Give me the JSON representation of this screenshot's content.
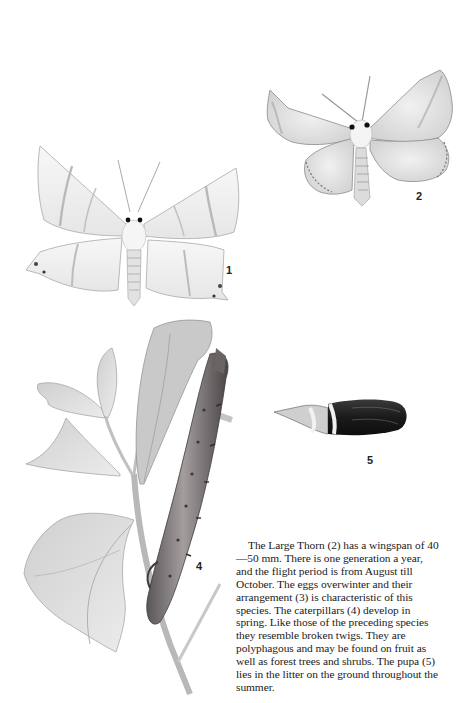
{
  "page": {
    "background": "#ffffff",
    "ink_color": "#1a1a1a"
  },
  "figures": [
    {
      "id": 1,
      "label": "1",
      "subject": "moth-adult-pale-thorn-icon",
      "description": "pale moth with hooked wing tips, dorsal view"
    },
    {
      "id": 2,
      "label": "2",
      "subject": "moth-adult-large-thorn-icon",
      "description": "Large Thorn moth, dorsal view, scalloped wing margins"
    },
    {
      "id": 4,
      "label": "4",
      "subject": "caterpillar-on-twig-icon",
      "description": "twig-like caterpillar on hawthorn branch with leaves"
    },
    {
      "id": 5,
      "label": "5",
      "subject": "pupa-icon",
      "description": "dark banded pupa"
    }
  ],
  "caption": {
    "text": "The Large Thorn (2) has a wingspan of 40—50 mm. There is one generation a year, and the flight period is from August till October. The eggs overwinter and their arrangement (3) is characteristic of this species. The caterpillars (4) develop in spring. Like those of the preceding species they resemble broken twigs. They are polyphagous and may be found on fruit as well as forest trees and shrubs. The pupa (5) lies in the litter on the ground throughout the summer."
  }
}
